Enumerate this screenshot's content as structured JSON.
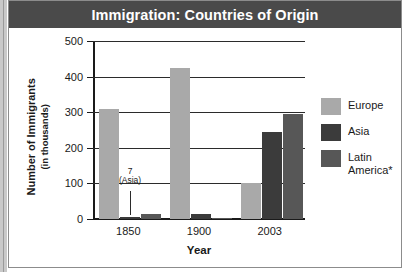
{
  "figure": {
    "title": "Immigration: Countries of Origin",
    "colors": {
      "title_bar": "#4a4a4a",
      "europe": "#a9a9a9",
      "asia": "#3b3b3b",
      "latin_america": "#575757",
      "axis": "#1a1a1a"
    }
  },
  "chart_data": {
    "type": "bar",
    "title": "Immigration: Countries of Origin",
    "xlabel": "Year",
    "ylabel": "Number of Immigrants",
    "ylabel_sub": "(in thousands)",
    "categories": [
      "1850",
      "1900",
      "2003"
    ],
    "ylim": [
      0,
      500
    ],
    "yticks": [
      0,
      100,
      200,
      300,
      400,
      500
    ],
    "ytick_labels": [
      "0",
      "100",
      "200",
      "300",
      "400",
      "500"
    ],
    "grid": true,
    "legend_position": "right",
    "series": [
      {
        "name": "Europe",
        "color": "#a9a9a9",
        "values": [
          308,
          425,
          100
        ]
      },
      {
        "name": "Asia",
        "color": "#3b3b3b",
        "values": [
          7,
          15,
          245
        ]
      },
      {
        "name": "Latin America*",
        "color": "#575757",
        "values": [
          15,
          3,
          295
        ]
      }
    ],
    "annotations": [
      {
        "value": "7",
        "label": "(Asia)",
        "series": "Asia",
        "category": "1850"
      }
    ]
  },
  "legend": {
    "items": [
      {
        "label": "Europe",
        "color": "#a9a9a9"
      },
      {
        "label": "Asia",
        "color": "#3b3b3b"
      },
      {
        "label_line1": "Latin",
        "label_line2": "America*",
        "color": "#575757"
      }
    ]
  }
}
